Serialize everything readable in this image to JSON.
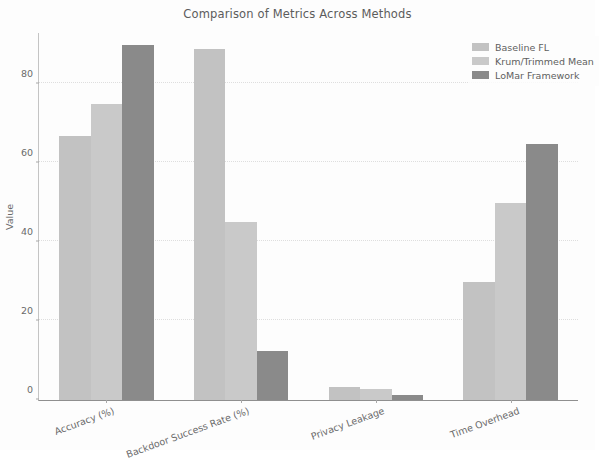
{
  "chart_data": {
    "type": "bar",
    "title": "Comparison of Metrics Across Methods",
    "xlabel": "",
    "ylabel": "Value",
    "categories": [
      "Accuracy (%)",
      "Backdoor Success Rate (%)",
      "Privacy Leakage",
      "Time Overhead"
    ],
    "series": [
      {
        "name": "Baseline FL",
        "color": "#c2c2c2",
        "values": [
          67,
          89,
          3.2,
          30
        ]
      },
      {
        "name": "Krum/Trimmed Mean",
        "color": "#c9c9c9",
        "values": [
          75,
          45,
          2.7,
          50
        ]
      },
      {
        "name": "LoMar Framework",
        "color": "#8a8a8a",
        "values": [
          90,
          12.5,
          1.2,
          65
        ]
      }
    ],
    "ylim": [
      0,
      93
    ],
    "yticks": [
      0,
      20,
      40,
      60,
      80
    ],
    "ytick_labels": [
      "0",
      "20",
      "40",
      "60",
      "80"
    ],
    "grid": true,
    "grid_axis": "y",
    "legend_position": "upper right",
    "xtick_rotation": -20
  },
  "legend": {
    "entries": [
      {
        "label": "Baseline FL",
        "color": "#c2c2c2"
      },
      {
        "label": "Krum/Trimmed Mean",
        "color": "#c9c9c9"
      },
      {
        "label": "LoMar Framework",
        "color": "#8a8a8a"
      }
    ]
  }
}
